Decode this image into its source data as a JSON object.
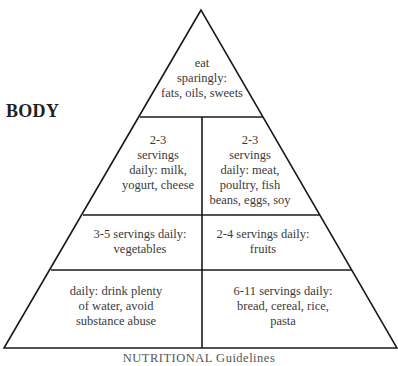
{
  "diagram": {
    "type": "food-pyramid",
    "side_label": "BODY",
    "bottom_label": "NUTRITIONAL Guidelines",
    "line_color": "#1a1a1a",
    "text_color": "#3a3a3a",
    "tiers": [
      {
        "name": "top",
        "cells": [
          {
            "id": "fats-oils-sweets",
            "text": "eat\nsparingly:\nfats, oils, sweets"
          }
        ]
      },
      {
        "name": "second",
        "cells": [
          {
            "id": "milk-yogurt-cheese",
            "text": "2-3\nservings\ndaily: milk,\nyogurt, cheese"
          },
          {
            "id": "meat-poultry-fish",
            "text": "2-3\nservings\ndaily: meat,\npoultry, fish\nbeans, eggs, soy"
          }
        ]
      },
      {
        "name": "third",
        "cells": [
          {
            "id": "vegetables",
            "text": "3-5 servings daily:\nvegetables"
          },
          {
            "id": "fruits",
            "text": "2-4 servings daily:\nfruits"
          }
        ]
      },
      {
        "name": "base",
        "cells": [
          {
            "id": "water",
            "text": "daily: drink plenty\nof water, avoid\nsubstance abuse"
          },
          {
            "id": "bread-cereal-rice-pasta",
            "text": "6-11 servings daily:\nbread, cereal, rice, pasta"
          }
        ]
      }
    ]
  }
}
